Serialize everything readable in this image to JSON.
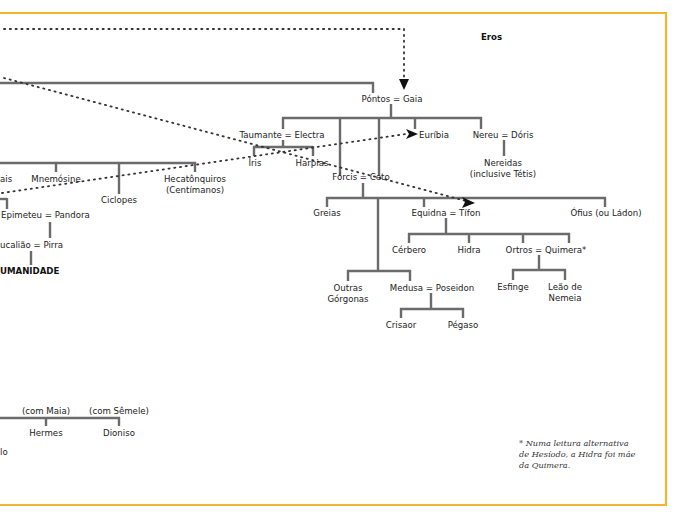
{
  "diagram": {
    "type": "genealogy-tree",
    "title_fragment": "",
    "colors": {
      "frame": "#f2b431",
      "line": "#6b6b6b",
      "dotted": "#333333",
      "text": "#222222"
    },
    "root": {
      "label": "Eros"
    },
    "nodes": {
      "pontos_gaia": "Póntos = Gaia",
      "taumante_electra": "Taumante = Electra",
      "euribia": "Euríbia",
      "nereu_doris": "Nereu = Dóris",
      "nereidas_1": "Nereidas",
      "nereidas_2": "(inclusive Tétis)",
      "iris": "Íris",
      "harpias": "Harpias",
      "forcis_ceto": "Fórcis = Ceto",
      "greias": "Greias",
      "equidna_tifon": "Equidna = Tífon",
      "ofius": "Ófius (ou Ládon)",
      "cerbero": "Cérbero",
      "hidra": "Hidra",
      "ortros_quimera": "Ortros = Quimera*",
      "outras_1": "Outras",
      "outras_2": "Górgonas",
      "medusa_poseidon": "Medusa = Poseidon",
      "esfinge": "Esfinge",
      "leao_1": "Leão de",
      "leao_2": "Nemeia",
      "crisaor": "Crisaor",
      "pegaso": "Pégaso",
      "titanides_cut": "ais",
      "mnemosine": "Mnemósine",
      "ciclopes": "Ciclopes",
      "hecatonquiros_1": "Hecatônquiros",
      "hecatonquiros_2": "(Centímanos)",
      "epimeteu_pandora": "Epimeteu = Pandora",
      "deucaliao_pirra": "ucalião = Pirra",
      "humanidade": "UMANIDADE",
      "com_maia": "(com Maia)",
      "com_semele": "(com Sêmele)",
      "hermes": "Hermes",
      "dioniso": "Dioniso",
      "apolo_cut": "lo"
    },
    "footnote": {
      "line1": "* Numa leitura alternativa",
      "line2": "de Hesíodo, a Hidra foi mãe",
      "line3": "da Quimera."
    }
  }
}
